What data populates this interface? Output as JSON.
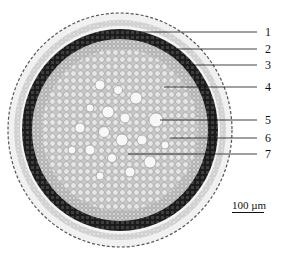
{
  "figure": {
    "labels": [
      {
        "id": "1",
        "text": "1",
        "y": 32,
        "line_from_x": 140
      },
      {
        "id": "2",
        "text": "2",
        "y": 49,
        "line_from_x": 177
      },
      {
        "id": "3",
        "text": "3",
        "y": 65,
        "line_from_x": 193
      },
      {
        "id": "4",
        "text": "4",
        "y": 87,
        "line_from_x": 164
      },
      {
        "id": "5",
        "text": "5",
        "y": 120,
        "line_from_x": 160
      },
      {
        "id": "6",
        "text": "6",
        "y": 138,
        "line_from_x": 170
      },
      {
        "id": "7",
        "text": "7",
        "y": 154,
        "line_from_x": 128
      }
    ],
    "scale_bar": {
      "text": "100 µm"
    },
    "colors": {
      "ring": "#2a2a2a",
      "cells_fill": "#d9d9d9",
      "cells_edge": "#7a7a7a",
      "background": "#ffffff"
    }
  }
}
